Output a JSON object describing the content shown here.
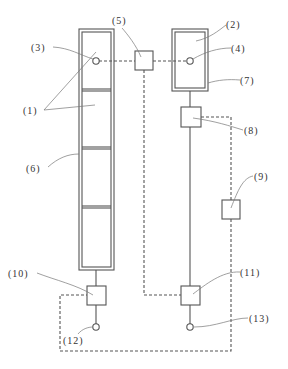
{
  "diagram": {
    "type": "schematic",
    "colors": {
      "line": "#555555",
      "leader": "#777777",
      "text": "#333333",
      "background": "#ffffff"
    },
    "labels": {
      "l1": "(1)",
      "l2": "(2)",
      "l3": "(3)",
      "l4": "(4)",
      "l5": "(5)",
      "l6": "(6)",
      "l7": "(7)",
      "l8": "(8)",
      "l9": "(9)",
      "l10": "(10)",
      "l11": "(11)",
      "l12": "(12)",
      "l13": "(13)"
    },
    "components": [
      {
        "id": "1",
        "desc": "stacked cells (4) in left column"
      },
      {
        "id": "2",
        "desc": "single cell in right frame"
      },
      {
        "id": "3",
        "desc": "sensor point in top left cell"
      },
      {
        "id": "4",
        "desc": "sensor point in right cell"
      },
      {
        "id": "5",
        "desc": "box connected by dashed lines"
      },
      {
        "id": "6",
        "desc": "left outer frame"
      },
      {
        "id": "7",
        "desc": "right outer frame"
      },
      {
        "id": "8",
        "desc": "box on right line"
      },
      {
        "id": "9",
        "desc": "box on dashed line"
      },
      {
        "id": "10",
        "desc": "box below left column"
      },
      {
        "id": "11",
        "desc": "box below right line"
      },
      {
        "id": "12",
        "desc": "terminal circle left"
      },
      {
        "id": "13",
        "desc": "terminal circle right"
      }
    ]
  }
}
